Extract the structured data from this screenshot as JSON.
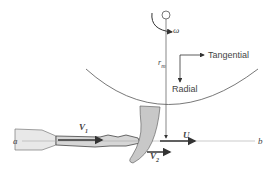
{
  "diagram": {
    "type": "impulse turbine (Pelton wheel) jet and bucket schematic",
    "labels": {
      "omega": "ω",
      "r_m": "r",
      "r_m_sub": "m",
      "tangential": "Tangential",
      "radial": "Radial",
      "v1": "V",
      "v1_sub": "1",
      "v2": "V",
      "v2_sub": "2",
      "u": "U",
      "a": "a",
      "b": "b"
    },
    "colors": {
      "line": "#555555",
      "bucket_fill": "#c8c8c8",
      "nozzle_fill": "#e8e8e8",
      "jet_fill": "#d6d6d6",
      "arrow": "#333333"
    }
  }
}
